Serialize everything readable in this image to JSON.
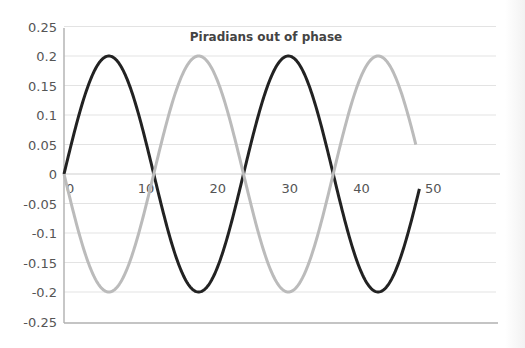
{
  "chart_data": {
    "type": "line",
    "title": "Piradians out of phase",
    "xlabel": "",
    "ylabel": "",
    "xlim": [
      0,
      50
    ],
    "ylim": [
      -0.25,
      0.25
    ],
    "x_ticks": [
      "0",
      "10",
      "20",
      "30",
      "40",
      "50"
    ],
    "y_ticks": [
      "0.25",
      "0.2",
      "0.15",
      "0.1",
      "0.05",
      "0",
      "-0.05",
      "-0.1",
      "-0.15",
      "-0.2",
      "-0.25"
    ],
    "grid": true,
    "legend": "none",
    "period": 25,
    "amplitude": 0.2,
    "series": [
      {
        "name": "Series 1",
        "color": "#222222",
        "formula": "0.2*sin(2*pi*x/25)",
        "x": [
          0,
          6.25,
          12.5,
          18.75,
          25,
          31.25,
          37.5,
          43.75,
          49.5
        ],
        "values": [
          0,
          0.2,
          0,
          -0.2,
          0,
          0.2,
          0,
          -0.2,
          -0.01
        ]
      },
      {
        "name": "Series 2",
        "color": "#bbbbbb",
        "formula": "-0.2*sin(2*pi*x/25)",
        "x": [
          0,
          6.25,
          12.5,
          18.75,
          25,
          31.25,
          37.5,
          43.75,
          49
        ],
        "values": [
          0,
          -0.2,
          0,
          0.2,
          0,
          -0.2,
          0,
          0.2,
          0.01
        ]
      }
    ]
  },
  "colors": {
    "axis": "#b5b5b5",
    "grid": "#e3e3e3",
    "tick_label": "#555555",
    "title": "#444444"
  }
}
